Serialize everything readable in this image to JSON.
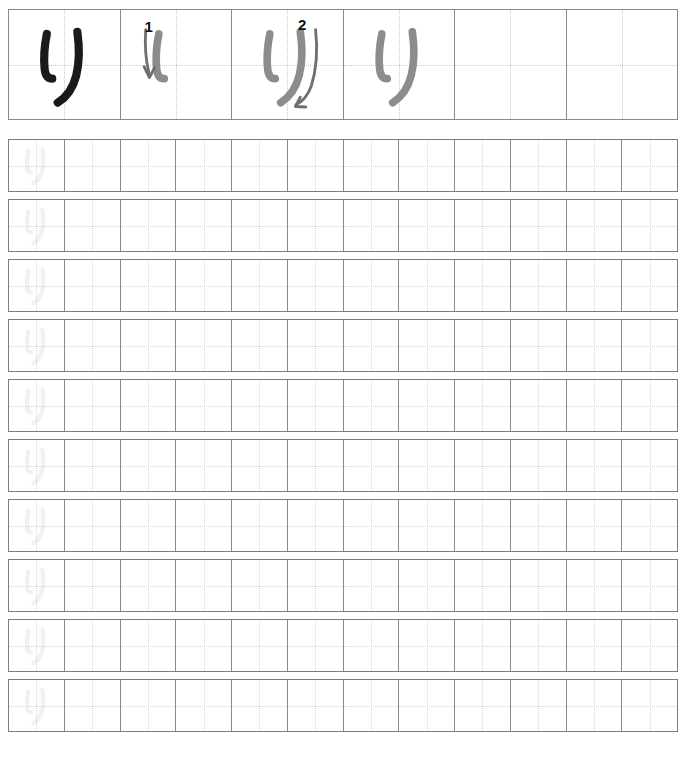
{
  "worksheet": {
    "title": "Kanji / Kana stroke-order practice sheet",
    "character": "り",
    "character_romaji": "ri",
    "stroke_count": 2,
    "colors": {
      "ink_solid": "#1a1a1a",
      "ink_guide": "#8c8c8c",
      "ink_trace": "#9a9a9a",
      "grid_border": "#8a8a8a",
      "grid_outer": "#7d7d7d",
      "guide_dots": "#c9c9c9",
      "stroke_number": "#111111",
      "page_background": "#ffffff"
    }
  },
  "demo_row": {
    "name": "stroke-order-demo-row",
    "cell_count": 6,
    "cells": [
      {
        "index": 0,
        "type": "model",
        "glyph": "り",
        "ink": "solid",
        "stroke_number": null,
        "arrow": false
      },
      {
        "index": 1,
        "type": "stroke-step",
        "glyph": "り",
        "ink": "guide",
        "stroke_number": "1",
        "arrow": true,
        "arrow_stroke": 1
      },
      {
        "index": 2,
        "type": "stroke-step",
        "glyph": "り",
        "ink": "guide",
        "stroke_number": "2",
        "arrow": true,
        "arrow_stroke": 2
      },
      {
        "index": 3,
        "type": "complete",
        "glyph": "り",
        "ink": "guide",
        "stroke_number": null,
        "arrow": false
      },
      {
        "index": 4,
        "type": "blank",
        "glyph": "",
        "ink": null,
        "stroke_number": null,
        "arrow": false
      },
      {
        "index": 5,
        "type": "blank",
        "glyph": "",
        "ink": null,
        "stroke_number": null,
        "arrow": false
      }
    ]
  },
  "practice_grid": {
    "name": "practice-grid",
    "row_count": 10,
    "cells_per_row": 12,
    "rows": [
      {
        "index": 0,
        "trace_cells": [
          0
        ],
        "blank_cells": [
          1,
          2,
          3,
          4,
          5,
          6,
          7,
          8,
          9,
          10,
          11
        ]
      },
      {
        "index": 1,
        "trace_cells": [
          0
        ],
        "blank_cells": [
          1,
          2,
          3,
          4,
          5,
          6,
          7,
          8,
          9,
          10,
          11
        ]
      },
      {
        "index": 2,
        "trace_cells": [
          0
        ],
        "blank_cells": [
          1,
          2,
          3,
          4,
          5,
          6,
          7,
          8,
          9,
          10,
          11
        ]
      },
      {
        "index": 3,
        "trace_cells": [
          0
        ],
        "blank_cells": [
          1,
          2,
          3,
          4,
          5,
          6,
          7,
          8,
          9,
          10,
          11
        ]
      },
      {
        "index": 4,
        "trace_cells": [
          0
        ],
        "blank_cells": [
          1,
          2,
          3,
          4,
          5,
          6,
          7,
          8,
          9,
          10,
          11
        ]
      },
      {
        "index": 5,
        "trace_cells": [
          0
        ],
        "blank_cells": [
          1,
          2,
          3,
          4,
          5,
          6,
          7,
          8,
          9,
          10,
          11
        ]
      },
      {
        "index": 6,
        "trace_cells": [
          0
        ],
        "blank_cells": [
          1,
          2,
          3,
          4,
          5,
          6,
          7,
          8,
          9,
          10,
          11
        ]
      },
      {
        "index": 7,
        "trace_cells": [
          0
        ],
        "blank_cells": [
          1,
          2,
          3,
          4,
          5,
          6,
          7,
          8,
          9,
          10,
          11
        ]
      },
      {
        "index": 8,
        "trace_cells": [
          0
        ],
        "blank_cells": [
          1,
          2,
          3,
          4,
          5,
          6,
          7,
          8,
          9,
          10,
          11
        ]
      },
      {
        "index": 9,
        "trace_cells": [
          0
        ],
        "blank_cells": [
          1,
          2,
          3,
          4,
          5,
          6,
          7,
          8,
          9,
          10,
          11
        ]
      }
    ]
  }
}
